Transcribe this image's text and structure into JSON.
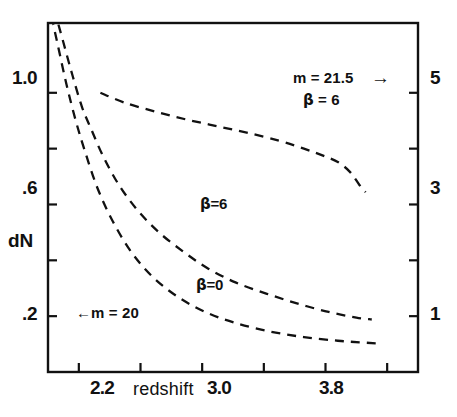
{
  "figure": {
    "background_color": "#ffffff",
    "ink_color": "#111111"
  },
  "axes": {
    "x": {
      "label": "redshift",
      "tick_values": [
        2.2,
        2.6,
        3.0,
        3.4,
        3.8,
        4.2
      ],
      "tick_labels": [
        "2.2",
        "",
        "3.0",
        "",
        "3.8",
        ""
      ],
      "range": [
        2.0,
        4.4
      ]
    },
    "y_left": {
      "label": "dN",
      "tick_values": [
        1.0,
        0.8,
        0.6,
        0.4,
        0.2
      ],
      "tick_labels": [
        "1.0",
        "",
        ".6",
        "dN",
        ".2"
      ],
      "range": [
        0.0,
        1.25
      ]
    },
    "y_right": {
      "label": "",
      "tick_values": [
        5,
        4,
        3,
        2,
        1
      ],
      "tick_labels": [
        "5",
        "",
        "3",
        "",
        "1"
      ],
      "range": [
        0,
        6.25
      ]
    }
  },
  "annotations": {
    "left_marker": {
      "arrow": "←",
      "text": "m = 20"
    },
    "right_marker": {
      "text_line1": "m = 21.5",
      "arrow": "→",
      "text_line2_beta": "β",
      "text_line2_rest": " = 6"
    },
    "curve_label_beta6": {
      "beta": "β",
      "rest": "=6"
    },
    "curve_label_beta0": {
      "beta": "β",
      "rest": "=0"
    }
  },
  "chart_data": {
    "type": "line",
    "title": "",
    "xlabel": "redshift",
    "ylabel": "dN",
    "xlim": [
      2.0,
      4.4
    ],
    "ylim": [
      0.0,
      1.25
    ],
    "y2lim": [
      0.0,
      6.25
    ],
    "grid": false,
    "legend": "inline-annotations",
    "linestyle": "dashed",
    "xticks": [
      2.2,
      2.6,
      3.0,
      3.4,
      3.8,
      4.2
    ],
    "xticklabels": [
      "2.2",
      "",
      "3.0",
      "",
      "3.8",
      ""
    ],
    "yticks": [
      0.2,
      0.4,
      0.6,
      0.8,
      1.0
    ],
    "yticklabels": [
      ".2",
      "dN",
      ".6",
      "",
      "1.0"
    ],
    "y2ticks": [
      1,
      2,
      3,
      4,
      5
    ],
    "y2ticklabels": [
      "1",
      "",
      "3",
      "",
      "5"
    ],
    "series": [
      {
        "name": "m = 21.5, beta = 6",
        "axis": "right",
        "label_text": "m = 21.5",
        "x": [
          2.34,
          2.5,
          2.7,
          2.9,
          3.1,
          3.3,
          3.5,
          3.66,
          3.78,
          3.88,
          3.96,
          4.02,
          4.06
        ],
        "y": [
          5.0,
          4.82,
          4.66,
          4.52,
          4.4,
          4.28,
          4.14,
          4.0,
          3.88,
          3.76,
          3.58,
          3.35,
          3.22
        ]
      },
      {
        "name": "beta = 6",
        "axis": "left",
        "label_text": "β=6",
        "x": [
          2.04,
          2.1,
          2.16,
          2.22,
          2.28,
          2.36,
          2.46,
          2.58,
          2.72,
          2.88,
          3.04,
          3.22,
          3.42,
          3.62,
          3.82,
          4.0,
          4.1
        ],
        "y": [
          1.3,
          1.18,
          1.06,
          0.95,
          0.87,
          0.77,
          0.67,
          0.58,
          0.5,
          0.43,
          0.37,
          0.32,
          0.28,
          0.245,
          0.215,
          0.195,
          0.188
        ]
      },
      {
        "name": "beta = 0",
        "axis": "left",
        "label_text": "β=0",
        "x": [
          2.0,
          2.06,
          2.12,
          2.18,
          2.24,
          2.32,
          2.42,
          2.54,
          2.68,
          2.84,
          3.02,
          3.22,
          3.44,
          3.66,
          3.88,
          4.06,
          4.14
        ],
        "y": [
          1.33,
          1.18,
          1.03,
          0.9,
          0.79,
          0.66,
          0.54,
          0.43,
          0.34,
          0.27,
          0.215,
          0.175,
          0.145,
          0.125,
          0.112,
          0.105,
          0.102
        ]
      }
    ]
  }
}
